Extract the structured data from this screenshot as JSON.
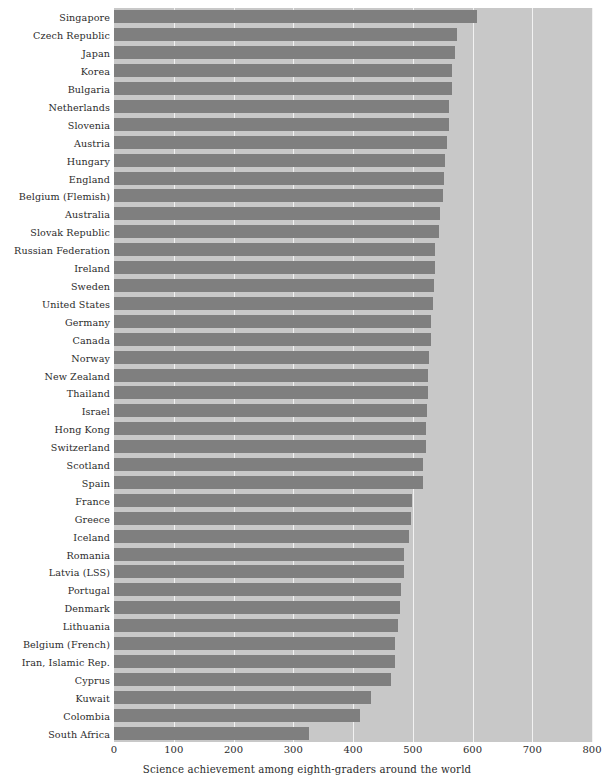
{
  "chart_data": {
    "type": "bar",
    "orientation": "horizontal",
    "title": "",
    "xlabel": "Science achievement among eighth-graders around the world",
    "ylabel": "",
    "xlim": [
      0,
      800
    ],
    "xticks": [
      0,
      100,
      200,
      300,
      400,
      500,
      600,
      700,
      800
    ],
    "grid": true,
    "legend": false,
    "bar_color": "#7f7f7f",
    "panel_color": "#c8c8c8",
    "gridline_color": "#f2f2f2",
    "categories": [
      "Singapore",
      "Czech Republic",
      "Japan",
      "Korea",
      "Bulgaria",
      "Netherlands",
      "Slovenia",
      "Austria",
      "Hungary",
      "England",
      "Belgium (Flemish)",
      "Australia",
      "Slovak Republic",
      "Russian Federation",
      "Ireland",
      "Sweden",
      "United States",
      "Germany",
      "Canada",
      "Norway",
      "New Zealand",
      "Thailand",
      "Israel",
      "Hong Kong",
      "Switzerland",
      "Scotland",
      "Spain",
      "France",
      "Greece",
      "Iceland",
      "Romania",
      "Latvia (LSS)",
      "Portugal",
      "Denmark",
      "Lithuania",
      "Belgium (French)",
      "Iran, Islamic Rep.",
      "Cyprus",
      "Kuwait",
      "Colombia",
      "South Africa"
    ],
    "values": [
      607,
      574,
      571,
      565,
      565,
      560,
      560,
      558,
      554,
      552,
      550,
      545,
      544,
      538,
      538,
      535,
      534,
      531,
      531,
      527,
      525,
      525,
      524,
      522,
      522,
      517,
      517,
      498,
      497,
      494,
      486,
      485,
      480,
      478,
      476,
      471,
      470,
      463,
      430,
      411,
      326
    ],
    "unit": "score"
  },
  "axis": {
    "tick_labels": [
      "0",
      "100",
      "200",
      "300",
      "400",
      "500",
      "600",
      "700",
      "800"
    ]
  }
}
